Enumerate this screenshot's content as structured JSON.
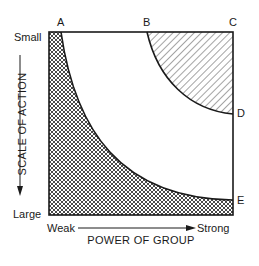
{
  "diagram": {
    "points": {
      "A": "A",
      "B": "B",
      "C": "C",
      "D": "D",
      "E": "E"
    },
    "y_axis": {
      "label": "SCALE OF ACTION",
      "top": "Small",
      "bottom": "Large"
    },
    "x_axis": {
      "label": "POWER OF GROUP",
      "left": "Weak",
      "right": "Strong"
    },
    "regions": [
      {
        "name": "crosshatched-region",
        "pattern": "crosshatch",
        "bounded_by": "A-E curve"
      },
      {
        "name": "hatched-region",
        "pattern": "diagonal",
        "bounded_by": "B-D curve"
      }
    ],
    "colors": {
      "ink": "#1a1a1a",
      "background": "#ffffff"
    }
  }
}
